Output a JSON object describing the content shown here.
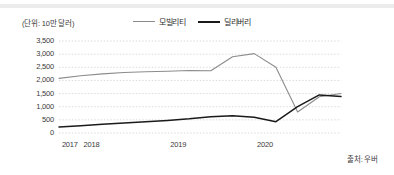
{
  "chart_data": {
    "type": "line",
    "title": "",
    "unit_label": "(단위: 10만 달러)",
    "source": "출처: 우버",
    "xlabel": "",
    "ylabel": "",
    "ylim": [
      0,
      3500
    ],
    "yticks": [
      "0",
      "500",
      "1,000",
      "1,500",
      "2,000",
      "2,500",
      "3,000",
      "3,500"
    ],
    "ytick_values": [
      0,
      500,
      1000,
      1500,
      2000,
      2500,
      3000,
      3500
    ],
    "xticks": [
      "2017",
      "2018",
      "2019",
      "2020"
    ],
    "xtick_positions": [
      0.5,
      1.5,
      5.5,
      9.5
    ],
    "grid": true,
    "grid_style": "dotted",
    "legend_position": "top-center",
    "x": [
      0,
      1,
      2,
      3,
      4,
      5,
      6,
      7,
      8,
      9,
      10,
      11,
      12,
      13
    ],
    "series": [
      {
        "name": "모빌리티",
        "color": "#8c8c8c",
        "values": [
          2080,
          2180,
          2250,
          2300,
          2330,
          2350,
          2380,
          2370,
          2900,
          3020,
          2500,
          800,
          1380,
          1500
        ]
      },
      {
        "name": "딜리버리",
        "color": "#1a1a1a",
        "values": [
          230,
          280,
          330,
          380,
          430,
          480,
          540,
          620,
          660,
          600,
          430,
          1000,
          1450,
          1390
        ]
      }
    ]
  },
  "legend": {
    "items": [
      {
        "label": "모빌리티"
      },
      {
        "label": "딜리버리"
      }
    ]
  }
}
